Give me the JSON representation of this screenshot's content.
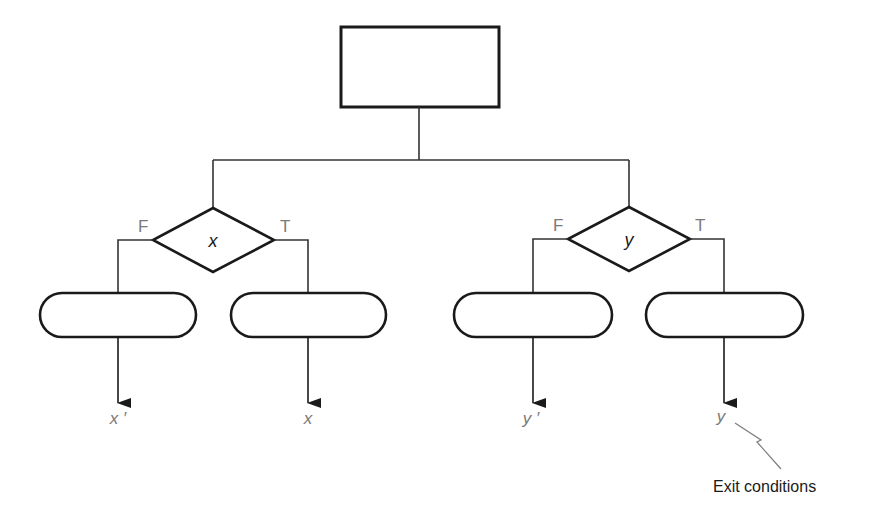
{
  "diagram": {
    "type": "flowchart",
    "colors": {
      "stroke": "#1a1a1a",
      "connector": "#333333",
      "label_gray": "#7a7a7a",
      "annotation_line": "#808080"
    },
    "top_box": {
      "label": ""
    },
    "decisions": [
      {
        "condition": "x",
        "false_label": "F",
        "true_label": "T",
        "false_action": "",
        "true_action": "",
        "false_exit": "x ′",
        "true_exit": "x"
      },
      {
        "condition": "y",
        "false_label": "F",
        "true_label": "T",
        "false_action": "",
        "true_action": "",
        "false_exit": "y ′",
        "true_exit": "y"
      }
    ],
    "annotation": {
      "text": "Exit conditions"
    }
  }
}
